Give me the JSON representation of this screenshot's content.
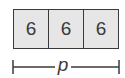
{
  "diagram": {
    "type": "tape-diagram",
    "cells": [
      {
        "value": "6"
      },
      {
        "value": "6"
      },
      {
        "value": "6"
      }
    ],
    "bracket_label": "p",
    "colors": {
      "cell_fill": "#e6e6e6",
      "stroke": "#3a3a3a"
    }
  }
}
